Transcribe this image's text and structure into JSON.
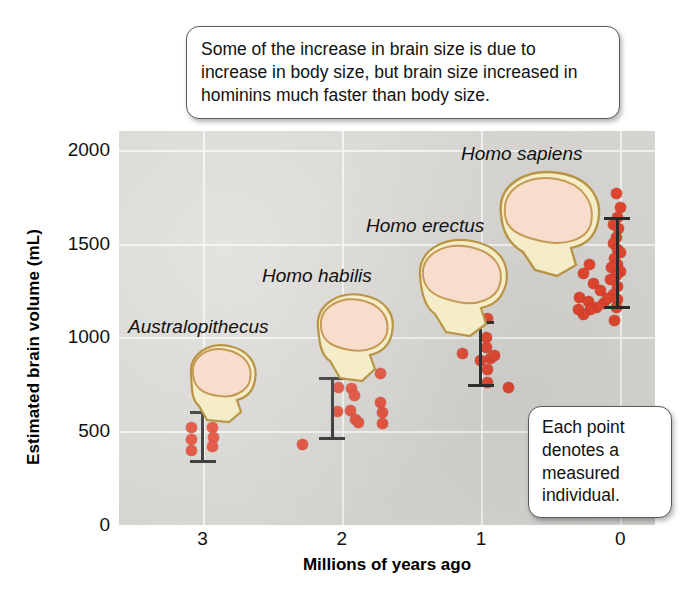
{
  "callouts": {
    "top": "Some of the increase in brain size is due to increase in body size, but brain size increased in hominins much faster than body size.",
    "points": "Each point denotes a measured individual."
  },
  "axes": {
    "y_title": "Estimated brain volume (mL)",
    "x_title": "Millions of years ago",
    "y_ticks": [
      "2000",
      "1500",
      "1000",
      "500",
      "0"
    ],
    "x_ticks": [
      "3",
      "2",
      "1",
      "0"
    ],
    "ylim": [
      0,
      2100
    ],
    "xlim": [
      3.6,
      -0.25
    ]
  },
  "species": [
    {
      "name": "Australopithecus",
      "label_x": 128,
      "label_y": 316
    },
    {
      "name": "Homo habilis",
      "label_x": 262,
      "label_y": 265
    },
    {
      "name": "Homo erectus",
      "label_x": 366,
      "label_y": 215
    },
    {
      "name": "Homo sapiens",
      "label_x": 461,
      "label_y": 143
    }
  ],
  "colors": {
    "point": "#e0452f",
    "plot_background": "#d6d4d0",
    "gridline": "#f2f1ee",
    "error_bar": "#2b2b2b",
    "skull_braincase": "#f6ddcf",
    "skull_bone": "#f5ecc8",
    "skull_outline": "#b79545"
  },
  "chart_data": {
    "type": "scatter",
    "xlabel": "Millions of years ago",
    "ylabel": "Estimated brain volume (mL)",
    "xlim": [
      3.6,
      -0.25
    ],
    "ylim": [
      0,
      2100
    ],
    "grid": true,
    "legend": "none",
    "x_ticks": [
      3,
      2,
      1,
      0
    ],
    "y_ticks": [
      0,
      500,
      1000,
      1500,
      2000
    ],
    "point_meaning": "Each point denotes a measured individual.",
    "series": [
      {
        "name": "Australopithecus",
        "error_bar": {
          "x": 3.0,
          "low": 330,
          "high": 610
        },
        "points": [
          {
            "x": 3.08,
            "y": 520
          },
          {
            "x": 3.08,
            "y": 455
          },
          {
            "x": 3.08,
            "y": 395
          },
          {
            "x": 2.93,
            "y": 520
          },
          {
            "x": 2.92,
            "y": 465
          },
          {
            "x": 2.93,
            "y": 420
          }
        ]
      },
      {
        "name": "Homo habilis",
        "error_bar": {
          "x": 2.07,
          "low": 455,
          "high": 790
        },
        "points": [
          {
            "x": 2.28,
            "y": 430
          },
          {
            "x": 2.02,
            "y": 735
          },
          {
            "x": 1.93,
            "y": 725
          },
          {
            "x": 1.91,
            "y": 690
          },
          {
            "x": 2.03,
            "y": 605
          },
          {
            "x": 1.94,
            "y": 610
          },
          {
            "x": 1.9,
            "y": 560
          },
          {
            "x": 1.88,
            "y": 545
          },
          {
            "x": 1.72,
            "y": 805
          },
          {
            "x": 1.72,
            "y": 655
          },
          {
            "x": 1.71,
            "y": 600
          },
          {
            "x": 1.71,
            "y": 540
          }
        ]
      },
      {
        "name": "Homo erectus",
        "error_bar": {
          "x": 1.0,
          "low": 735,
          "high": 1085
        },
        "points": [
          {
            "x": 1.13,
            "y": 915
          },
          {
            "x": 0.95,
            "y": 1100
          },
          {
            "x": 0.96,
            "y": 1000
          },
          {
            "x": 0.96,
            "y": 945
          },
          {
            "x": 0.93,
            "y": 890
          },
          {
            "x": 0.9,
            "y": 905
          },
          {
            "x": 1.0,
            "y": 875
          },
          {
            "x": 0.95,
            "y": 830
          },
          {
            "x": 0.95,
            "y": 760
          },
          {
            "x": 0.8,
            "y": 735
          }
        ]
      },
      {
        "name": "Homo sapiens",
        "error_bar": {
          "x": 0.02,
          "low": 1150,
          "high": 1640
        },
        "points": [
          {
            "x": 0.03,
            "y": 1765
          },
          {
            "x": 0.0,
            "y": 1690
          },
          {
            "x": 0.02,
            "y": 1640
          },
          {
            "x": 0.05,
            "y": 1600
          },
          {
            "x": 0.01,
            "y": 1580
          },
          {
            "x": 0.03,
            "y": 1530
          },
          {
            "x": 0.05,
            "y": 1500
          },
          {
            "x": 0.02,
            "y": 1470
          },
          {
            "x": 0.0,
            "y": 1450
          },
          {
            "x": 0.04,
            "y": 1420
          },
          {
            "x": 0.02,
            "y": 1390
          },
          {
            "x": 0.06,
            "y": 1370
          },
          {
            "x": 0.0,
            "y": 1350
          },
          {
            "x": 0.03,
            "y": 1330
          },
          {
            "x": 0.07,
            "y": 1310
          },
          {
            "x": 0.02,
            "y": 1270
          },
          {
            "x": 0.05,
            "y": 1230
          },
          {
            "x": 0.02,
            "y": 1200
          },
          {
            "x": 0.03,
            "y": 1160
          },
          {
            "x": 0.04,
            "y": 1090
          },
          {
            "x": 0.22,
            "y": 1390
          },
          {
            "x": 0.26,
            "y": 1340
          },
          {
            "x": 0.19,
            "y": 1285
          },
          {
            "x": 0.14,
            "y": 1250
          },
          {
            "x": 0.29,
            "y": 1215
          },
          {
            "x": 0.23,
            "y": 1190
          },
          {
            "x": 0.12,
            "y": 1180
          },
          {
            "x": 0.17,
            "y": 1160
          },
          {
            "x": 0.21,
            "y": 1150
          },
          {
            "x": 0.09,
            "y": 1205
          },
          {
            "x": 0.26,
            "y": 1120
          },
          {
            "x": 0.3,
            "y": 1150
          }
        ]
      }
    ]
  }
}
